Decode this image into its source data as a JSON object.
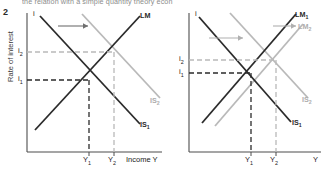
{
  "page": {
    "clipped_header_text": "the relation with a simple quantity theory econ",
    "figure_number": "2"
  },
  "axis_titles": {
    "y_long": "Rate of interest",
    "y_symbol": "i",
    "x_left": "Income Y",
    "x_right": "Y"
  },
  "colors": {
    "dark_curve": "#2b2b2b",
    "light_curve": "#b3b3b3",
    "axis": "#4d4d4d",
    "dark_dash": "#2b2b2b",
    "light_dash": "#b9b9b9",
    "label_dark": "#2b2b2b",
    "label_light": "#adadad",
    "background": "#ffffff"
  },
  "panels": [
    {
      "id": "left",
      "name": "is-shift-panel",
      "y_ticks": [
        {
          "label": "i",
          "sub": ""
        },
        {
          "label": "i",
          "sub": "2"
        },
        {
          "label": "i",
          "sub": "1"
        }
      ],
      "x_ticks": [
        {
          "label": "Y",
          "sub": "1"
        },
        {
          "label": "Y",
          "sub": "2"
        }
      ],
      "x_axis_title": "Income Y",
      "curves": [
        {
          "name": "LM",
          "label": "LM",
          "sub": "",
          "tone": "dark",
          "slope": "upward"
        },
        {
          "name": "IS1",
          "label": "IS",
          "sub": "1",
          "tone": "dark",
          "slope": "downward"
        },
        {
          "name": "IS2",
          "label": "IS",
          "sub": "2",
          "tone": "light",
          "slope": "downward"
        }
      ],
      "arrow": {
        "name": "is-shift-arrow",
        "direction": "right",
        "tone": "dark"
      },
      "equilibria": [
        {
          "name": "E1",
          "x_tick": "Y1",
          "y_tick": "i1",
          "tone": "dark"
        },
        {
          "name": "E2",
          "x_tick": "Y2",
          "y_tick": "i2",
          "tone": "light"
        }
      ]
    },
    {
      "id": "right",
      "name": "lm-shift-panel",
      "y_ticks": [
        {
          "label": "i",
          "sub": ""
        },
        {
          "label": "i",
          "sub": "2"
        },
        {
          "label": "i",
          "sub": "1"
        }
      ],
      "x_ticks": [
        {
          "label": "Y",
          "sub": "1"
        },
        {
          "label": "Y",
          "sub": "2"
        }
      ],
      "x_axis_title": "Y",
      "curves": [
        {
          "name": "LM1",
          "label": "LM",
          "sub": "1",
          "tone": "dark",
          "slope": "upward"
        },
        {
          "name": "LM2",
          "label": "LM",
          "sub": "2",
          "tone": "light",
          "slope": "upward"
        },
        {
          "name": "IS1",
          "label": "IS",
          "sub": "1",
          "tone": "dark",
          "slope": "downward"
        },
        {
          "name": "IS2",
          "label": "IS",
          "sub": "2",
          "tone": "light",
          "slope": "downward"
        }
      ],
      "arrows": [
        {
          "name": "is-shift-arrow",
          "direction": "right",
          "tone": "light"
        },
        {
          "name": "lm-shift-arrow",
          "direction": "right",
          "tone": "light"
        }
      ],
      "equilibria": [
        {
          "name": "E1",
          "x_tick": "Y1",
          "y_tick": "i1",
          "tone": "dark"
        },
        {
          "name": "E2",
          "x_tick": "Y2",
          "y_tick": "i2",
          "tone": "light"
        }
      ]
    }
  ]
}
